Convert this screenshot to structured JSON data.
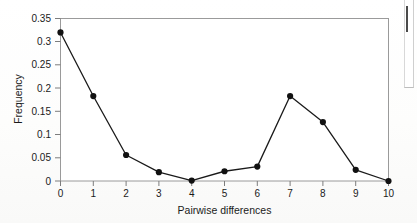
{
  "chart_data": {
    "type": "line",
    "title": "",
    "subtitle": "",
    "xlabel": "Pairwise differences",
    "ylabel": "Frequency",
    "x": [
      0,
      1,
      2,
      3,
      4,
      5,
      6,
      7,
      8,
      9,
      10
    ],
    "values": [
      0.32,
      0.183,
      0.056,
      0.019,
      0.001,
      0.021,
      0.031,
      0.183,
      0.127,
      0.024,
      0.0
    ],
    "series": [
      {
        "name": "Pairwise difference frequency",
        "values": [
          0.32,
          0.183,
          0.056,
          0.019,
          0.001,
          0.021,
          0.031,
          0.183,
          0.127,
          0.024,
          0.0
        ]
      }
    ],
    "xlim": [
      0,
      10
    ],
    "ylim": [
      0,
      0.35
    ],
    "xticks": [
      "0",
      "1",
      "2",
      "3",
      "4",
      "5",
      "6",
      "7",
      "8",
      "9",
      "10"
    ],
    "yticks": [
      "0",
      "0.05",
      "0.1",
      "0.15",
      "0.2",
      "0.25",
      "0.3",
      "0.35"
    ],
    "ytick_values": [
      0,
      0.05,
      0.1,
      0.15,
      0.2,
      0.25,
      0.3,
      0.35
    ],
    "grid": false,
    "legend": null,
    "legend_position": "none",
    "annotations": [],
    "marker": "filled-circle",
    "line_color": "#1a1a1a",
    "marker_color": "#111111",
    "axis_color": "#8a8a8a",
    "background_color": "#fefefe"
  }
}
